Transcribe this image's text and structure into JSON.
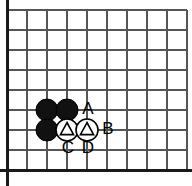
{
  "figure": {
    "kind": "go-board-diagram",
    "width": 192,
    "height": 186,
    "background_color": "#ffffff"
  },
  "board": {
    "grid": {
      "origin_x": 7,
      "origin_y": 10,
      "spacing": 20,
      "columns": 10,
      "rows": 9,
      "line_color": "#555555",
      "line_width": 1.2,
      "grid_on": true
    },
    "edges": {
      "left_border": true,
      "bottom_border": true,
      "top_border": false,
      "right_border": false,
      "border_color": "#1a1a1a",
      "border_width": 3
    }
  },
  "stones": [
    {
      "id": "black-1",
      "color": "black",
      "color_hex": "#111111",
      "col": 2,
      "row": 5,
      "x": 47,
      "y": 110,
      "radius": 11,
      "marker": "none"
    },
    {
      "id": "black-2",
      "color": "black",
      "color_hex": "#111111",
      "col": 3,
      "row": 5,
      "x": 67,
      "y": 110,
      "radius": 11,
      "marker": "none"
    },
    {
      "id": "black-3",
      "color": "black",
      "color_hex": "#111111",
      "col": 2,
      "row": 6,
      "x": 47,
      "y": 130,
      "radius": 11,
      "marker": "none"
    },
    {
      "id": "white-1",
      "color": "white",
      "color_hex": "#ffffff",
      "col": 3,
      "row": 6,
      "x": 67,
      "y": 130,
      "radius": 11,
      "marker": "triangle"
    },
    {
      "id": "white-2",
      "color": "white",
      "color_hex": "#ffffff",
      "col": 4,
      "row": 6,
      "x": 87,
      "y": 130,
      "radius": 11,
      "marker": "triangle"
    }
  ],
  "labels": [
    {
      "id": "label-a",
      "text": "A",
      "x": 88,
      "y": 109
    },
    {
      "id": "label-b",
      "text": "B",
      "x": 108,
      "y": 129
    },
    {
      "id": "label-c",
      "text": "C",
      "x": 68,
      "y": 148
    },
    {
      "id": "label-d",
      "text": "D",
      "x": 88,
      "y": 148
    }
  ],
  "colors": {
    "stone_black": "#111111",
    "stone_white": "#ffffff",
    "stone_outline": "#000000",
    "grid_line": "#555555",
    "board_border": "#1a1a1a",
    "label_text": "#000000",
    "background": "#ffffff"
  }
}
